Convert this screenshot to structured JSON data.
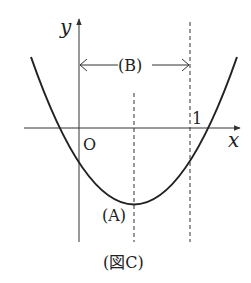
{
  "figure": {
    "caption": "(図C)",
    "axes": {
      "x_label": "x",
      "y_label": "y",
      "origin_label": "O"
    },
    "tick_labels": {
      "one": "1"
    },
    "annotations": {
      "vertex_label": "(A)",
      "interval_label": "(B)"
    },
    "curve": {
      "type": "parabola",
      "opens": "up",
      "description": "Upward parabola with vertex (A) to the right of the y-axis, between x=0 and x=1; y-intercept negative; roots left of O and right of 1"
    },
    "guides": {
      "dashed_vertical_lines": [
        "axis of symmetry through vertex (A)",
        "x = 1"
      ],
      "interval_arrow": "double-headed arrow (B) spanning from y-axis to x = 1"
    }
  },
  "colors": {
    "line": "#222222",
    "axis": "#333333",
    "background": "#ffffff"
  }
}
